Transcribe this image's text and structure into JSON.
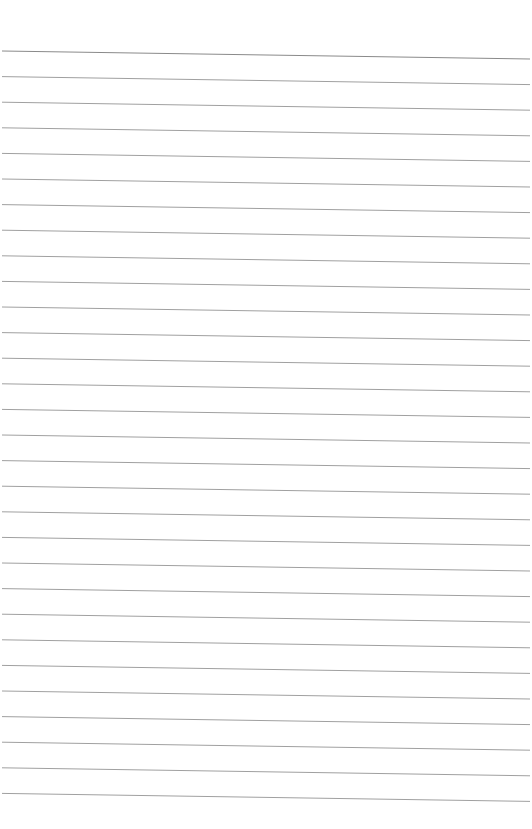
{
  "page": {
    "type": "lined-paper",
    "background": "#ffffff",
    "line_color": "#a0a0a0",
    "line_count": 30,
    "first_line_y_left": 51,
    "line_spacing": 25.6,
    "slope_drop": 8,
    "x_start": 2,
    "x_end": 530
  }
}
